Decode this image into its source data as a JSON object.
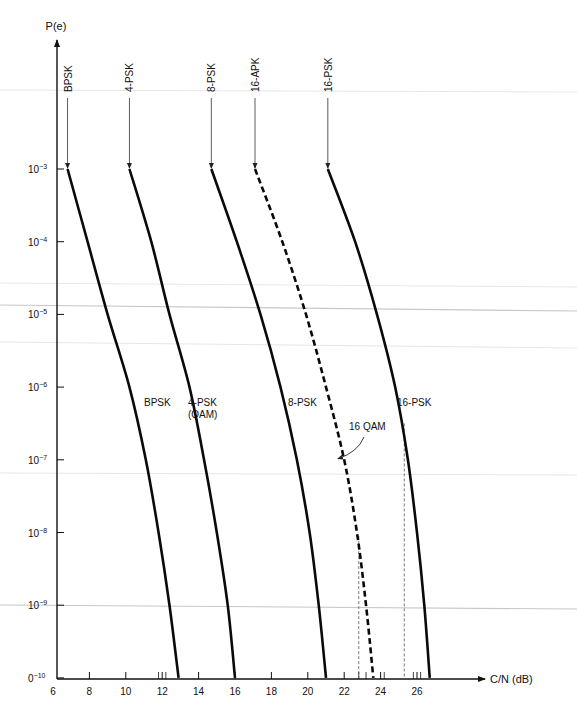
{
  "chart_data": {
    "type": "line",
    "title": "",
    "xlabel": "C/N (dB)",
    "ylabel": "P(e)",
    "xlim": [
      6,
      27
    ],
    "ylim_exponent": [
      -10,
      -3
    ],
    "yscale": "log",
    "grid": false,
    "x_ticks": [
      6,
      8,
      10,
      12,
      14,
      16,
      18,
      20,
      22,
      24,
      26
    ],
    "x_minor_ticks": [
      11.8,
      12.2,
      22.8,
      23.2,
      24.2,
      25.8,
      26.2
    ],
    "y_ticks": [
      {
        "exp": -3,
        "label": "10",
        "sup": "−3"
      },
      {
        "exp": -4,
        "label": "10",
        "sup": "−4"
      },
      {
        "exp": -5,
        "label": "10",
        "sup": "−5"
      },
      {
        "exp": -6,
        "label": "10",
        "sup": "−6"
      },
      {
        "exp": -7,
        "label": "10",
        "sup": "−7"
      },
      {
        "exp": -8,
        "label": "10",
        "sup": "−8"
      },
      {
        "exp": -9,
        "label": "10",
        "sup": "−9"
      },
      {
        "exp": -10,
        "label": "0",
        "sup": "−10"
      }
    ],
    "series": [
      {
        "name": "BPSK",
        "top_label": "BPSK",
        "mid_label": [
          "BPSK"
        ],
        "style": "solid",
        "points": [
          [
            6.8,
            -3
          ],
          [
            7.9,
            -4
          ],
          [
            9.0,
            -5
          ],
          [
            10.2,
            -6
          ],
          [
            11.1,
            -7
          ],
          [
            11.8,
            -8
          ],
          [
            12.4,
            -9
          ],
          [
            12.9,
            -10
          ]
        ]
      },
      {
        "name": "4-PSK (QAM)",
        "top_label": "4-PSK",
        "mid_label": [
          "4-PSK",
          "(QAM)"
        ],
        "style": "solid",
        "points": [
          [
            10.2,
            -3
          ],
          [
            11.4,
            -4
          ],
          [
            12.4,
            -5
          ],
          [
            13.5,
            -6
          ],
          [
            14.3,
            -7
          ],
          [
            15.0,
            -8
          ],
          [
            15.6,
            -9
          ],
          [
            16.0,
            -10
          ]
        ]
      },
      {
        "name": "8-PSK",
        "top_label": "8-PSK",
        "mid_label": [
          "8-PSK"
        ],
        "style": "solid",
        "points": [
          [
            14.7,
            -3
          ],
          [
            16.1,
            -4
          ],
          [
            17.4,
            -5
          ],
          [
            18.5,
            -6
          ],
          [
            19.4,
            -7
          ],
          [
            20.1,
            -8
          ],
          [
            20.6,
            -9
          ],
          [
            21.0,
            -10
          ]
        ]
      },
      {
        "name": "16-APK / 16 QAM",
        "top_label": "16-APK",
        "mid_label": [
          "16 QAM"
        ],
        "style": "dashed",
        "points": [
          [
            17.1,
            -3
          ],
          [
            18.6,
            -4
          ],
          [
            19.9,
            -5
          ],
          [
            21.0,
            -6
          ],
          [
            22.0,
            -7
          ],
          [
            22.7,
            -8
          ],
          [
            23.2,
            -9
          ],
          [
            23.6,
            -10
          ]
        ]
      },
      {
        "name": "16-PSK",
        "top_label": "16-PSK",
        "mid_label": [
          "16-PSK"
        ],
        "style": "solid",
        "points": [
          [
            21.1,
            -3
          ],
          [
            22.6,
            -4
          ],
          [
            23.8,
            -5
          ],
          [
            24.8,
            -6
          ],
          [
            25.5,
            -7
          ],
          [
            26.0,
            -8
          ],
          [
            26.4,
            -9
          ],
          [
            26.7,
            -10
          ]
        ]
      }
    ],
    "reference_lines": [
      {
        "x": 22.8,
        "from_exp": -8.05,
        "to_exp": -10
      },
      {
        "x": 25.3,
        "from_exp": -6.5,
        "to_exp": -10
      }
    ],
    "annotations": [
      {
        "text": "16 QAM",
        "points_to_series": "16-APK / 16 QAM",
        "at_exp": -7
      }
    ]
  }
}
